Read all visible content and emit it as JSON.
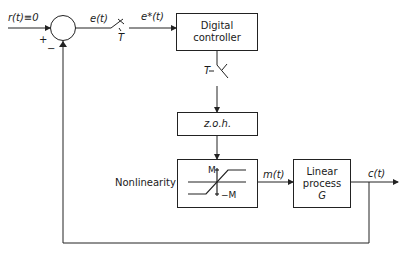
{
  "diagram": {
    "type": "sampled-data feedback control loop block diagram",
    "input_label": "r(t)≡0",
    "plus_sign": "+",
    "minus_sign": "−",
    "error_label": "e(t)",
    "sampled_error_label": "e*(t)",
    "sampler1_period": "T",
    "sampler2_period": "T",
    "blocks": {
      "controller": {
        "line1": "Digital",
        "line2": "controller"
      },
      "zoh": {
        "label": "z.o.h."
      },
      "nonlinearity": {
        "side_label": "Nonlinearity",
        "upper_limit": "M",
        "lower_limit": "−M"
      },
      "plant": {
        "line1": "Linear",
        "line2": "process",
        "line3": "G"
      }
    },
    "control_signal_label": "m(t)",
    "output_label": "c(t)"
  }
}
